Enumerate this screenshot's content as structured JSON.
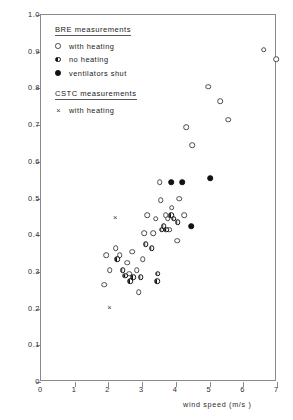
{
  "chart_data": {
    "type": "scatter",
    "title": "",
    "xlabel": "wind speed  (m/s )",
    "ylabel": "",
    "xlim": [
      0,
      7
    ],
    "ylim": [
      0,
      1.0
    ],
    "xticks": [
      "0",
      "1",
      "2",
      "3",
      "4",
      "5",
      "6",
      "7"
    ],
    "yticks": [
      "0",
      "0.1",
      "0.2",
      "0.3",
      "0.4",
      "0.5",
      "0.6",
      "0.7",
      "0.8",
      "0.9",
      "1.0"
    ],
    "grid": false,
    "legend_position": "upper-left-inside",
    "series": [
      {
        "name": "with heating",
        "group": "BRE measurements",
        "marker": "open-circle",
        "points": [
          [
            1.93,
            0.345
          ],
          [
            1.87,
            0.265
          ],
          [
            2.04,
            0.305
          ],
          [
            2.22,
            0.365
          ],
          [
            2.34,
            0.345
          ],
          [
            2.55,
            0.325
          ],
          [
            2.62,
            0.295
          ],
          [
            2.7,
            0.355
          ],
          [
            2.84,
            0.305
          ],
          [
            2.9,
            0.245
          ],
          [
            3.02,
            0.335
          ],
          [
            3.06,
            0.405
          ],
          [
            3.15,
            0.455
          ],
          [
            3.33,
            0.405
          ],
          [
            3.4,
            0.445
          ],
          [
            3.52,
            0.545
          ],
          [
            3.55,
            0.495
          ],
          [
            3.7,
            0.455
          ],
          [
            3.76,
            0.445
          ],
          [
            3.8,
            0.415
          ],
          [
            3.88,
            0.475
          ],
          [
            4.04,
            0.385
          ],
          [
            4.24,
            0.455
          ],
          [
            4.3,
            0.695
          ],
          [
            4.48,
            0.645
          ],
          [
            4.96,
            0.805
          ],
          [
            5.32,
            0.765
          ],
          [
            5.56,
            0.715
          ],
          [
            6.6,
            0.905
          ],
          [
            6.98,
            0.88
          ],
          [
            4.1,
            0.5
          ]
        ]
      },
      {
        "name": "no heating",
        "group": "BRE measurements",
        "marker": "half-filled-circle",
        "points": [
          [
            2.26,
            0.335
          ],
          [
            2.42,
            0.305
          ],
          [
            2.5,
            0.29
          ],
          [
            2.64,
            0.275
          ],
          [
            2.74,
            0.285
          ],
          [
            2.96,
            0.285
          ],
          [
            3.1,
            0.375
          ],
          [
            3.28,
            0.365
          ],
          [
            3.44,
            0.275
          ],
          [
            3.46,
            0.295
          ],
          [
            3.58,
            0.415
          ],
          [
            3.64,
            0.425
          ],
          [
            3.72,
            0.415
          ],
          [
            3.86,
            0.455
          ],
          [
            3.94,
            0.445
          ],
          [
            4.06,
            0.435
          ]
        ]
      },
      {
        "name": "ventilators shut",
        "group": "BRE measurements",
        "marker": "filled-circle",
        "points": [
          [
            3.86,
            0.545
          ],
          [
            4.18,
            0.545
          ],
          [
            4.46,
            0.425
          ],
          [
            5.02,
            0.555
          ]
        ]
      },
      {
        "name": "with heating",
        "group": "CSTC measurements",
        "marker": "cross",
        "points": [
          [
            2.2,
            0.45
          ],
          [
            2.03,
            0.205
          ]
        ]
      }
    ]
  },
  "legend": {
    "groups": [
      {
        "heading": "BRE measurements",
        "entries": [
          {
            "symbol": "open-circle",
            "label": "with heating"
          },
          {
            "symbol": "half-filled-circle",
            "label": "no heating"
          },
          {
            "symbol": "filled-circle",
            "label": "ventilators shut"
          }
        ]
      },
      {
        "heading": "CSTC measurements",
        "entries": [
          {
            "symbol": "cross",
            "label": "with heating"
          }
        ]
      }
    ]
  },
  "axes": {
    "x_axis_title": "wind speed  (m/s )"
  }
}
